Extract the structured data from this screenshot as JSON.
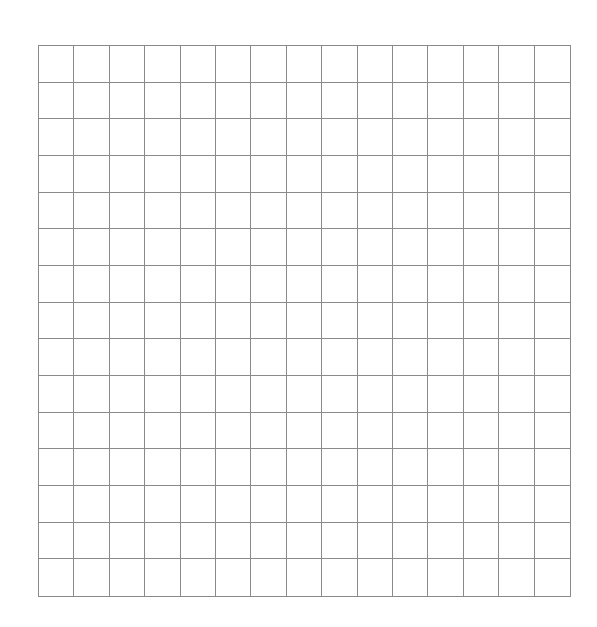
{
  "grid": {
    "rows": 15,
    "columns": 15,
    "line_color": "#8a8a8a",
    "background": "#ffffff"
  }
}
